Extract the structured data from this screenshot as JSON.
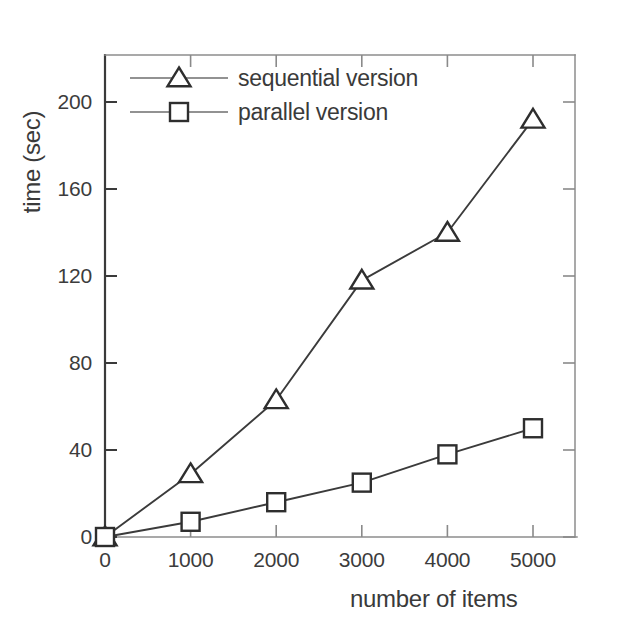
{
  "chart_data": {
    "type": "line",
    "title": "",
    "subtitle": "",
    "xlabel": "number of items",
    "ylabel": "time (sec)",
    "xlim": [
      0,
      5500
    ],
    "ylim": [
      0,
      225
    ],
    "xticks": [
      0,
      1000,
      2000,
      3000,
      4000,
      5000
    ],
    "xtick_labels": [
      "0",
      "1000",
      "2000",
      "3000",
      "4000",
      "5000"
    ],
    "yticks": [
      0,
      40,
      80,
      120,
      160,
      200
    ],
    "ytick_labels": [
      "0",
      "40",
      "80",
      "120",
      "160",
      "200"
    ],
    "grid": false,
    "legend_position": "top-left",
    "x": [
      0,
      1000,
      2000,
      3000,
      4000,
      5000
    ],
    "series": [
      {
        "name": "sequential version",
        "marker": "triangle",
        "values": [
          0,
          29,
          63,
          118,
          140,
          192
        ]
      },
      {
        "name": "parallel version",
        "marker": "square",
        "values": [
          0,
          7,
          16,
          25,
          38,
          50
        ]
      }
    ]
  },
  "legend": {
    "entries": [
      {
        "label": "sequential version",
        "marker": "triangle-marker"
      },
      {
        "label": "parallel version",
        "marker": "square-marker"
      }
    ]
  },
  "axes": {
    "y_axis_title": "time (sec)",
    "x_axis_title": "number of items"
  }
}
